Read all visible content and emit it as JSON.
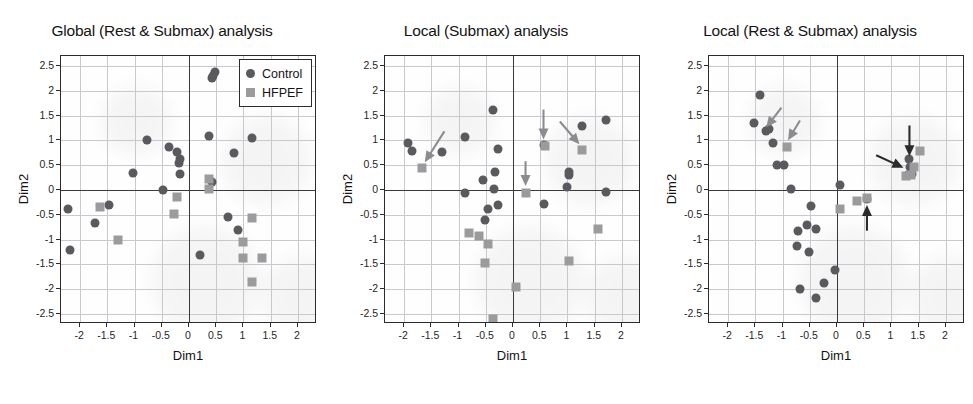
{
  "figure": {
    "legend": {
      "control_label": "Control",
      "hfpef_label": "HFPEF",
      "control_color": "#5a5a5e",
      "hfpef_color": "#9b9b9e"
    },
    "shared": {
      "xlabel": "Dim1",
      "ylabel": "Dim2",
      "xticks": [
        "-2",
        "-1.5",
        "-1",
        "-0.5",
        "0",
        "0.5",
        "1",
        "1.5",
        "2"
      ],
      "yticks": [
        "2.5",
        "2",
        "1.5",
        "1",
        "0.5",
        "0",
        "-0.5",
        "-1",
        "-1.5",
        "-2",
        "-2.5"
      ],
      "xlim": [
        -2.35,
        2.35
      ],
      "ylim": [
        -2.7,
        2.7
      ]
    }
  },
  "chart_data": [
    {
      "type": "scatter",
      "title": "Global (Rest & Submax) analysis",
      "xlabel": "Dim1",
      "ylabel": "Dim2",
      "xlim": [
        -2.35,
        2.35
      ],
      "ylim": [
        -2.7,
        2.7
      ],
      "grid": true,
      "legend_position": "top-right",
      "series": [
        {
          "name": "Control",
          "marker": "circle",
          "color": "#5a5a5e",
          "points": [
            [
              0.47,
              2.38
            ],
            [
              0.44,
              2.3
            ],
            [
              0.42,
              2.25
            ],
            [
              0.37,
              1.08
            ],
            [
              1.15,
              1.04
            ],
            [
              -0.77,
              1.01
            ],
            [
              -0.37,
              0.87
            ],
            [
              0.83,
              0.74
            ],
            [
              -0.22,
              0.76
            ],
            [
              -0.17,
              0.62
            ],
            [
              -0.19,
              0.55
            ],
            [
              -1.03,
              0.35
            ],
            [
              -0.17,
              0.33
            ],
            [
              0.43,
              0.16
            ],
            [
              -0.48,
              0.0
            ],
            [
              -1.46,
              -0.3
            ],
            [
              -2.23,
              -0.38
            ],
            [
              -1.72,
              -0.66
            ],
            [
              0.72,
              -0.54
            ],
            [
              0.9,
              -0.81
            ],
            [
              -2.19,
              -1.21
            ],
            [
              0.21,
              -1.3
            ]
          ]
        },
        {
          "name": "HFPEF",
          "marker": "square",
          "color": "#9b9b9e",
          "points": [
            [
              0.37,
              0.23
            ],
            [
              0.37,
              0.02
            ],
            [
              -0.22,
              -0.15
            ],
            [
              -1.63,
              -0.35
            ],
            [
              -0.28,
              -0.49
            ],
            [
              1.16,
              -0.56
            ],
            [
              -1.31,
              -1.0
            ],
            [
              1.0,
              -1.05
            ],
            [
              1.0,
              -1.38
            ],
            [
              1.34,
              -1.37
            ],
            [
              1.16,
              -1.86
            ]
          ]
        }
      ],
      "arrows": []
    },
    {
      "type": "scatter",
      "title": "Local (Submax) analysis",
      "xlabel": "Dim1",
      "ylabel": "Dim2",
      "xlim": [
        -2.35,
        2.35
      ],
      "ylim": [
        -2.7,
        2.7
      ],
      "grid": true,
      "legend_position": "none",
      "series": [
        {
          "name": "Control",
          "marker": "circle",
          "color": "#5a5a5e",
          "points": [
            [
              -0.37,
              1.62
            ],
            [
              1.71,
              1.41
            ],
            [
              1.27,
              1.29
            ],
            [
              -0.88,
              1.06
            ],
            [
              -1.93,
              0.94
            ],
            [
              -1.85,
              0.79
            ],
            [
              -1.3,
              0.77
            ],
            [
              -0.28,
              0.82
            ],
            [
              0.57,
              0.91
            ],
            [
              -0.33,
              0.36
            ],
            [
              -0.55,
              0.2
            ],
            [
              1.02,
              0.36
            ],
            [
              1.02,
              0.3
            ],
            [
              -0.35,
              0.03
            ],
            [
              1.0,
              0.07
            ],
            [
              -0.88,
              -0.07
            ],
            [
              1.71,
              -0.04
            ],
            [
              -0.27,
              -0.31
            ],
            [
              -0.46,
              -0.38
            ],
            [
              0.56,
              -0.28
            ],
            [
              -0.52,
              -0.61
            ]
          ]
        },
        {
          "name": "HFPEF",
          "marker": "square",
          "color": "#9b9b9e",
          "points": [
            [
              -1.67,
              0.45
            ],
            [
              0.58,
              0.88
            ],
            [
              1.27,
              0.81
            ],
            [
              0.23,
              -0.07
            ],
            [
              -0.8,
              -0.86
            ],
            [
              -0.63,
              -0.92
            ],
            [
              1.56,
              -0.78
            ],
            [
              -0.45,
              -1.09
            ],
            [
              -0.52,
              -1.48
            ],
            [
              1.03,
              -1.44
            ],
            [
              0.06,
              -1.96
            ],
            [
              -0.36,
              -2.6
            ]
          ]
        }
      ],
      "arrows": [
        {
          "from": [
            -1.26,
            1.18
          ],
          "to": [
            -1.62,
            0.56
          ],
          "color": "#8c8c90"
        },
        {
          "from": [
            0.56,
            1.62
          ],
          "to": [
            0.56,
            1.02
          ],
          "color": "#8c8c90"
        },
        {
          "from": [
            0.86,
            1.38
          ],
          "to": [
            1.22,
            0.92
          ],
          "color": "#8c8c90"
        },
        {
          "from": [
            0.23,
            0.58
          ],
          "to": [
            0.23,
            0.08
          ],
          "color": "#8c8c90"
        }
      ]
    },
    {
      "type": "scatter",
      "title": "Local (Rest & Submax) analysis",
      "xlabel": "Dim1",
      "ylabel": "Dim2",
      "xlim": [
        -2.35,
        2.35
      ],
      "ylim": [
        -2.7,
        2.7
      ],
      "grid": true,
      "legend_position": "none",
      "series": [
        {
          "name": "Control",
          "marker": "circle",
          "color": "#5a5a5e",
          "points": [
            [
              -1.42,
              1.92
            ],
            [
              -1.52,
              1.35
            ],
            [
              -1.3,
              1.19
            ],
            [
              -1.25,
              1.22
            ],
            [
              -1.18,
              0.94
            ],
            [
              -1.1,
              0.5
            ],
            [
              -0.97,
              0.51
            ],
            [
              1.33,
              0.63
            ],
            [
              1.34,
              0.46
            ],
            [
              1.37,
              0.32
            ],
            [
              1.3,
              0.31
            ],
            [
              -0.85,
              0.03
            ],
            [
              0.05,
              0.11
            ],
            [
              0.55,
              -0.19
            ],
            [
              -0.48,
              -0.33
            ],
            [
              -0.72,
              -0.83
            ],
            [
              -0.55,
              -0.7
            ],
            [
              -0.38,
              -0.78
            ],
            [
              -0.73,
              -1.12
            ],
            [
              -0.52,
              -1.24
            ],
            [
              -0.03,
              -1.62
            ],
            [
              -0.23,
              -1.88
            ],
            [
              -0.68,
              -2.0
            ],
            [
              -0.38,
              -2.18
            ]
          ]
        },
        {
          "name": "HFPEF",
          "marker": "square",
          "color": "#9b9b9e",
          "points": [
            [
              -0.92,
              0.86
            ],
            [
              1.52,
              0.79
            ],
            [
              1.42,
              0.47
            ],
            [
              1.27,
              0.28
            ],
            [
              1.36,
              0.3
            ],
            [
              0.55,
              -0.17
            ],
            [
              0.36,
              -0.22
            ],
            [
              0.06,
              -0.39
            ]
          ]
        }
      ],
      "arrows": [
        {
          "from": [
            -1.02,
            1.66
          ],
          "to": [
            -1.3,
            1.26
          ],
          "color": "#8c8c90"
        },
        {
          "from": [
            -0.68,
            1.4
          ],
          "to": [
            -0.9,
            1.0
          ],
          "color": "#8c8c90"
        },
        {
          "from": [
            1.33,
            1.3
          ],
          "to": [
            1.33,
            0.68
          ],
          "color": "#2b2b2b"
        },
        {
          "from": [
            0.72,
            0.7
          ],
          "to": [
            1.22,
            0.45
          ],
          "color": "#2b2b2b"
        },
        {
          "from": [
            0.55,
            -0.82
          ],
          "to": [
            0.55,
            -0.3
          ],
          "color": "#2b2b2b"
        }
      ]
    }
  ]
}
